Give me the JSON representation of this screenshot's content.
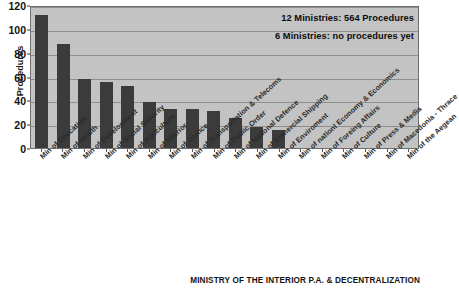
{
  "chart_data": {
    "type": "bar",
    "title": "",
    "xlabel": "",
    "ylabel": "Procedures",
    "ylim": [
      0,
      120
    ],
    "yticks": [
      0,
      20,
      40,
      60,
      80,
      100,
      120
    ],
    "grid": true,
    "legend": "none",
    "bar_color": "#3b3b3b",
    "plot_background": "#c3c3c3",
    "categories": [
      "Min of Education",
      "Min of Health",
      "Min of Development",
      "Min of Social Security",
      "Min of Agriculture",
      "Min of Interior",
      "Min of Justice",
      "Min of Transportation & Telecoms",
      "Min of Public Order",
      "Min of National Defence",
      "Min of Comercial Shipping",
      "Min of Enviroment",
      "Min of nationl Economy & Economics",
      "Min of Foreing Affairs",
      "Min of Culture",
      "Min of Press & Media",
      "Min of Macedonia - Thrace",
      "Min of the Aegean"
    ],
    "values": [
      112,
      87,
      58,
      55,
      52,
      39,
      33,
      33,
      31,
      25,
      18,
      15,
      0,
      0,
      0,
      0,
      0,
      0
    ],
    "annotations": [
      "12 Ministries: 564 Procedures",
      "6 Ministries: no procedures yet"
    ]
  },
  "footer": {
    "caption": "MINISTRY OF THE INTERIOR P.A. & DECENTRALIZATION"
  }
}
